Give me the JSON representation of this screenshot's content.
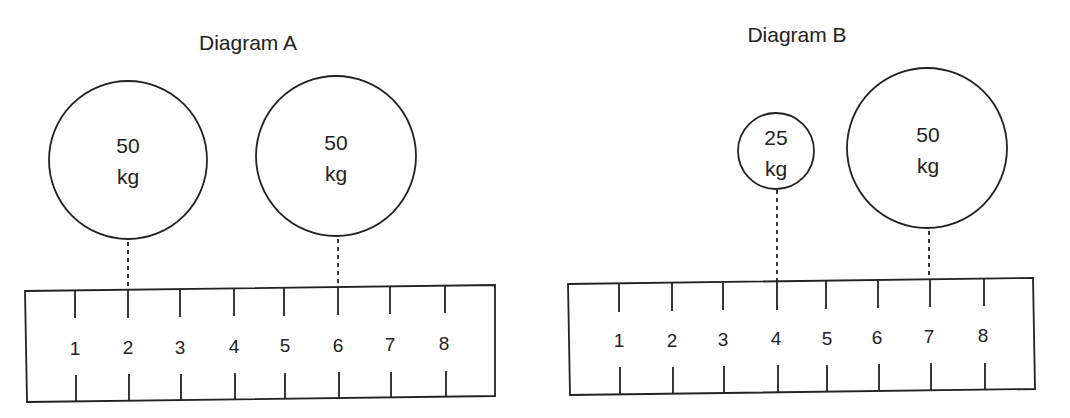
{
  "diagrams": [
    {
      "id": "A",
      "title": "Diagram A",
      "title_pos": [
        248,
        50
      ],
      "ruler": {
        "corners": [
          [
            25,
            291
          ],
          [
            495,
            285
          ],
          [
            495,
            396
          ],
          [
            27,
            402
          ]
        ],
        "labels": [
          "1",
          "2",
          "3",
          "4",
          "5",
          "6",
          "7",
          "8"
        ],
        "tick_x": [
          75,
          128,
          180,
          234,
          284,
          338,
          390,
          445
        ],
        "tick_top_y": [
          [
            290,
            318
          ]
        ],
        "tick_bottom_y": [
          [
            375,
            401
          ]
        ],
        "label_y": 355
      },
      "weights": [
        {
          "value": "50",
          "unit": "kg",
          "position": "2",
          "cx": 128,
          "cy": 160,
          "r": 79,
          "tick_x": 128
        },
        {
          "value": "50",
          "unit": "kg",
          "position": "6",
          "cx": 336,
          "cy": 156,
          "r": 80,
          "tick_x": 338
        }
      ]
    },
    {
      "id": "B",
      "title": "Diagram B",
      "title_pos": [
        797,
        42
      ],
      "ruler": {
        "corners": [
          [
            568,
            284
          ],
          [
            1033,
            278
          ],
          [
            1035,
            389
          ],
          [
            570,
            395
          ]
        ],
        "labels": [
          "1",
          "2",
          "3",
          "4",
          "5",
          "6",
          "7",
          "8"
        ],
        "tick_x": [
          619,
          672,
          723,
          776,
          826,
          878,
          930,
          984
        ],
        "tick_top_y": [
          [
            283,
            310
          ]
        ],
        "tick_bottom_y": [
          [
            368,
            394
          ]
        ],
        "label_y": 347
      },
      "weights": [
        {
          "value": "25",
          "unit": "kg",
          "position": "4",
          "cx": 776,
          "cy": 151,
          "r": 38,
          "tick_x": 776
        },
        {
          "value": "50",
          "unit": "kg",
          "position": "7",
          "cx": 927,
          "cy": 148,
          "r": 80,
          "tick_x": 929
        }
      ]
    }
  ]
}
